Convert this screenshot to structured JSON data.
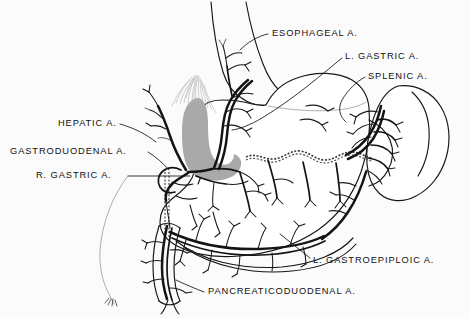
{
  "figure": {
    "medium": "pen-and-ink anatomical line drawing",
    "background_color": "#fbfbfb",
    "ink_color": "#141414",
    "shading_color": "#a9a9a9"
  },
  "labels": [
    {
      "id": "esophageal",
      "text": "ESOPHAGEAL  A.",
      "x": 272,
      "y": 33,
      "leader": "line from label left edge angling down-left to the esophageal branch beside the esophagus"
    },
    {
      "id": "left-gastric",
      "text": "L. GASTRIC  A.",
      "x": 345,
      "y": 56,
      "leader": "long line sweeping down-left across the stomach to the left gastric artery on the lesser curvature"
    },
    {
      "id": "splenic",
      "text": "SPLENIC  A.",
      "x": 368,
      "y": 76,
      "leader": "short line curving down-left to the splenic artery at the splenic hilum"
    },
    {
      "id": "hepatic",
      "text": "HEPATIC  A.",
      "x": 58,
      "y": 123,
      "leader": "line angling down-right to the hepatic artery ascending toward the liver"
    },
    {
      "id": "gastroduodenal",
      "text": "GASTRODUODENAL  A.",
      "x": 10,
      "y": 151,
      "leader": "line angling down-right to the gastroduodenal artery behind the duodenum"
    },
    {
      "id": "right-gastric",
      "text": "R. GASTRIC  A.",
      "x": 36,
      "y": 175,
      "leader": "line running right to the right gastric artery near the pylorus"
    },
    {
      "id": "left-gastroepiploic",
      "text": "L. GASTROEPIPLOIC  A.",
      "x": 313,
      "y": 260,
      "leader": "line angling up-left to the gastroepiploic arcade on the greater curvature"
    },
    {
      "id": "pancreaticoduodenal",
      "text": "PANCREATICODUODENAL  A.",
      "x": 208,
      "y": 291,
      "leader": "line angling up-left to the pancreaticoduodenal artery on the duodenum"
    }
  ],
  "structures": [
    {
      "id": "esophagus",
      "name": "esophagus",
      "note": "tubular structure descending from top edge into the cardia"
    },
    {
      "id": "stomach",
      "name": "stomach",
      "note": "large central organ, fundus upper right, body, antrum and pylorus at lower left"
    },
    {
      "id": "spleen",
      "name": "spleen",
      "note": "bean-shaped organ at right, splenic artery branching into its hilum"
    },
    {
      "id": "duodenum",
      "name": "duodenum",
      "note": "descending loop at lower left receiving the pancreaticoduodenal artery"
    },
    {
      "id": "liver-lobe",
      "name": "caudate lobe region",
      "note": "gray-shaded mass behind the lesser curvature with fine hatching above"
    },
    {
      "id": "pancreas-border",
      "name": "pancreas border",
      "note": "wavy dashed line running behind the stomach from the lesser curvature to the splenic hilum"
    }
  ]
}
